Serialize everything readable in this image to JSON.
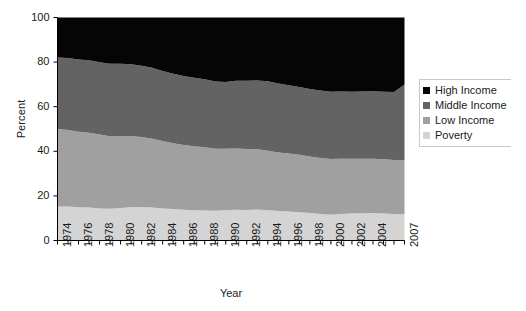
{
  "chart_data": {
    "type": "area",
    "stacked": true,
    "title": "",
    "xlabel": "Year",
    "ylabel": "Percent",
    "xlim": [
      1974,
      2007
    ],
    "ylim": [
      0,
      100
    ],
    "grid": false,
    "legend_position": "right",
    "y_ticks": [
      0,
      20,
      40,
      60,
      80,
      100
    ],
    "x_ticks": [
      1974,
      1976,
      1978,
      1980,
      1982,
      1984,
      1986,
      1988,
      1990,
      1992,
      1994,
      1996,
      1998,
      2000,
      2002,
      2004,
      2007
    ],
    "x": [
      1974,
      1975,
      1976,
      1977,
      1978,
      1979,
      1980,
      1981,
      1982,
      1983,
      1984,
      1985,
      1986,
      1987,
      1988,
      1989,
      1990,
      1991,
      1992,
      1993,
      1994,
      1995,
      1996,
      1997,
      1998,
      1999,
      2000,
      2001,
      2002,
      2003,
      2004,
      2005,
      2006,
      2007
    ],
    "series": [
      {
        "name": "Poverty",
        "color": "#d4d4d4",
        "values": [
          15.3,
          15.2,
          14.9,
          14.8,
          14.4,
          14.2,
          14.6,
          14.9,
          15.0,
          14.8,
          14.4,
          14.1,
          13.8,
          13.6,
          13.5,
          13.3,
          13.6,
          13.8,
          13.7,
          13.9,
          13.6,
          13.2,
          13.0,
          12.7,
          12.3,
          11.9,
          11.6,
          11.9,
          12.1,
          12.2,
          12.3,
          12.1,
          11.9,
          11.8
        ]
      },
      {
        "name": "Low Income",
        "color": "#a0a0a0",
        "values": [
          34.7,
          34.4,
          33.9,
          33.5,
          33.1,
          32.5,
          32.3,
          31.9,
          31.4,
          30.8,
          30.2,
          29.5,
          29.0,
          28.7,
          28.3,
          27.8,
          27.5,
          27.4,
          27.3,
          27.0,
          26.7,
          26.3,
          26.0,
          25.7,
          25.4,
          25.1,
          24.9,
          24.8,
          24.6,
          24.5,
          24.4,
          24.3,
          24.2,
          24.2
        ]
      },
      {
        "name": "Middle Income",
        "color": "#636363",
        "values": [
          32.1,
          32.2,
          32.4,
          32.5,
          32.4,
          32.6,
          32.4,
          32.2,
          32.0,
          31.9,
          31.4,
          31.2,
          31.0,
          30.7,
          30.5,
          30.2,
          30.0,
          30.4,
          30.6,
          30.9,
          31.1,
          30.9,
          30.6,
          30.4,
          30.2,
          30.3,
          30.2,
          30.1,
          30.0,
          30.1,
          30.2,
          30.3,
          30.5,
          34.0
        ]
      },
      {
        "name": "High Income",
        "color": "#050505",
        "values": [
          17.9,
          18.2,
          18.8,
          19.2,
          20.1,
          20.7,
          20.7,
          21.0,
          21.6,
          22.5,
          24.0,
          25.2,
          26.2,
          27.0,
          27.7,
          28.7,
          28.9,
          28.4,
          28.4,
          28.2,
          28.6,
          29.6,
          30.4,
          31.2,
          32.1,
          32.7,
          33.3,
          33.2,
          33.3,
          33.2,
          33.1,
          33.3,
          33.4,
          30.0
        ]
      }
    ]
  },
  "legend": {
    "items": [
      {
        "label": "High Income",
        "color": "#050505"
      },
      {
        "label": "Middle Income",
        "color": "#636363"
      },
      {
        "label": "Low Income",
        "color": "#a0a0a0"
      },
      {
        "label": "Poverty",
        "color": "#d4d4d4"
      }
    ]
  },
  "axes": {
    "y_title": "Percent",
    "x_title": "Year"
  }
}
